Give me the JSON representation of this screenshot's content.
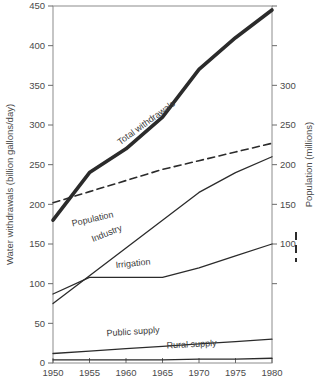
{
  "chart_data": {
    "type": "line",
    "title": "",
    "xlabel": "",
    "ylabel": "Water withdrawals (billion gallons/day)",
    "y2label": "Population (millions)",
    "x": [
      1950,
      1955,
      1960,
      1965,
      1970,
      1975,
      1980
    ],
    "xlim": [
      1950,
      1980
    ],
    "ylim": [
      0,
      450
    ],
    "y2lim": [
      50,
      400
    ],
    "yticks": [
      0,
      50,
      100,
      150,
      200,
      250,
      300,
      350,
      400,
      450
    ],
    "ytick_labels": [
      "0",
      "50",
      "100",
      "150",
      "200",
      "250",
      "300",
      "350",
      "400",
      "450"
    ],
    "y2ticks": [
      100,
      150,
      200,
      250,
      300
    ],
    "y2tick_labels": [
      "100",
      "150",
      "200",
      "250",
      "300"
    ],
    "xticks": [
      1950,
      1955,
      1960,
      1965,
      1970,
      1975,
      1980
    ],
    "xtick_labels": [
      "1950",
      "1955",
      "1960",
      "1965",
      "1970",
      "1975",
      "1980"
    ],
    "grid": false,
    "legend_position": "inline-curve-labels",
    "series": [
      {
        "name": "Total withdrawals",
        "axis": "left",
        "style": "thick-solid",
        "color": "#2b2b2b",
        "values": [
          180,
          240,
          270,
          310,
          370,
          410,
          445
        ]
      },
      {
        "name": "Population",
        "axis": "right",
        "style": "dashed",
        "color": "#2b2b2b",
        "values": [
          152,
          166,
          180,
          194,
          205,
          216,
          227
        ]
      },
      {
        "name": "Industry",
        "axis": "left",
        "style": "solid",
        "color": "#2b2b2b",
        "values": [
          75,
          110,
          145,
          180,
          215,
          240,
          260
        ]
      },
      {
        "name": "Irrigation",
        "axis": "left",
        "style": "solid",
        "color": "#2b2b2b",
        "values": [
          87,
          108,
          108,
          108,
          120,
          135,
          150
        ]
      },
      {
        "name": "Public supply",
        "axis": "left",
        "style": "solid",
        "color": "#2b2b2b",
        "values": [
          12,
          15,
          18,
          21,
          24,
          27,
          30
        ]
      },
      {
        "name": "Rural supply",
        "axis": "left",
        "style": "solid",
        "color": "#2b2b2b",
        "values": [
          4,
          4,
          4,
          4,
          5,
          5,
          6
        ]
      }
    ],
    "annotations": [
      {
        "text": "Total withdrawals",
        "x": 1963,
        "y": 300,
        "rotation": -36
      },
      {
        "text": "Population",
        "x": 1955.5,
        "y": 178,
        "rotation": -13
      },
      {
        "text": "Industry",
        "x": 1957.5,
        "y": 160,
        "rotation": -22
      },
      {
        "text": "Irrigation",
        "x": 1961,
        "y": 122,
        "rotation": -6
      },
      {
        "text": "Public supply",
        "x": 1961,
        "y": 36,
        "rotation": -4
      },
      {
        "text": "Rural supply",
        "x": 1969,
        "y": 20,
        "rotation": -3
      }
    ],
    "legend_key": {
      "label": "Population",
      "style": "dashed",
      "marker": "vertical-dashed-bar"
    }
  }
}
